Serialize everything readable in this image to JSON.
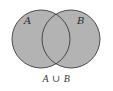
{
  "diagram": {
    "type": "venn",
    "operation": "union",
    "caption": "A ∪ B",
    "fill_color": "#b3b3b3",
    "stroke_color": "#3c3c3c",
    "background": "#ffffff",
    "sets": [
      {
        "label": "A",
        "shaded": true
      },
      {
        "label": "B",
        "shaded": true
      }
    ],
    "intersection_shaded": true
  }
}
